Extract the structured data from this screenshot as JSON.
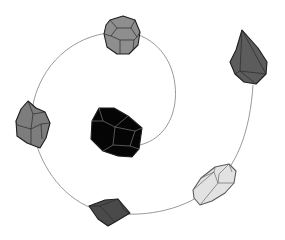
{
  "diagram": {
    "title": "",
    "background": "#ffffff",
    "spiral": {
      "stroke": "#9a9a9a",
      "start": [
        140,
        145
      ],
      "end": [
        253,
        85
      ]
    },
    "crystals": [
      {
        "id": "center",
        "shape": "truncated-polyhedron",
        "fill": "#050505",
        "position": [
          117,
          132
        ],
        "order": 1
      },
      {
        "id": "top",
        "shape": "truncated-octahedron",
        "fill": "#8e8e8e",
        "position": [
          121,
          33
        ],
        "order": 2
      },
      {
        "id": "left",
        "shape": "rhombic-prism",
        "fill": "#7d7d7d",
        "position": [
          33,
          124
        ],
        "order": 3
      },
      {
        "id": "bottom",
        "shape": "flat-rhomb",
        "fill": "#4a4a4a",
        "position": [
          109,
          212
        ],
        "order": 4
      },
      {
        "id": "lower-right",
        "shape": "elongated-prism",
        "fill": "#e2e2e2",
        "position": [
          213,
          184
        ],
        "order": 5
      },
      {
        "id": "upper-right",
        "shape": "pointed-bipyramid",
        "fill": "#5c5c5c",
        "position": [
          248,
          58
        ],
        "order": 6
      }
    ]
  }
}
